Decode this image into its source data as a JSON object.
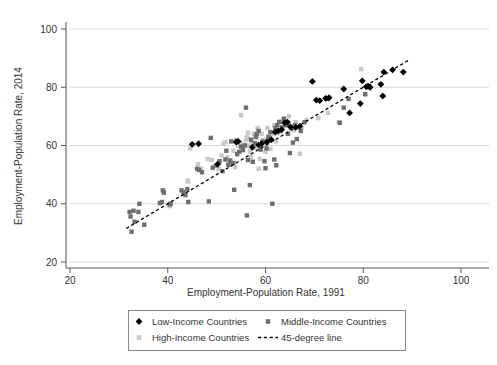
{
  "chart_data": {
    "type": "scatter",
    "title": "",
    "xlabel": "Employment-Population Rate, 1991",
    "ylabel": "Employment-Population Rate, 2014",
    "xlim": [
      20,
      100
    ],
    "ylim": [
      20,
      100
    ],
    "xticks": [
      20,
      40,
      60,
      80,
      100
    ],
    "yticks": [
      20,
      40,
      60,
      80,
      100
    ],
    "xtick_labels": [
      "20",
      "40",
      "60",
      "80",
      "100"
    ],
    "ytick_labels": [
      "20",
      "40",
      "60",
      "80",
      "100"
    ],
    "grid": "horizontal",
    "legend_position": "below-axes",
    "colors": {
      "low_income": "#000000",
      "middle_income": "#6e6e6e",
      "high_income": "#c9c9c9",
      "reference_line": "#000000",
      "gridline": "#d9d9d9",
      "axis": "#555555"
    },
    "reference_line": {
      "label": "45-degree line",
      "style": "dashed",
      "x0": 31.5,
      "y0": 31.5,
      "x1": 89.5,
      "y1": 89.5
    },
    "series": [
      {
        "name": "Low-Income Countries",
        "marker": "diamond",
        "color": "#000000",
        "points": [
          [
            45.0,
            60.4
          ],
          [
            46.3,
            60.6
          ],
          [
            50.2,
            53.6
          ],
          [
            54.0,
            61.2
          ],
          [
            54.4,
            61.4
          ],
          [
            57.3,
            59.4
          ],
          [
            58.6,
            60.2
          ],
          [
            59.2,
            60.6
          ],
          [
            60.3,
            61.2
          ],
          [
            61.2,
            62.0
          ],
          [
            62.0,
            64.6
          ],
          [
            62.6,
            65.0
          ],
          [
            63.3,
            65.4
          ],
          [
            63.9,
            67.8
          ],
          [
            64.5,
            68.0
          ],
          [
            65.1,
            66.4
          ],
          [
            66.2,
            66.2
          ],
          [
            67.0,
            66.6
          ],
          [
            69.6,
            82.0
          ],
          [
            70.4,
            75.6
          ],
          [
            71.1,
            75.4
          ],
          [
            72.3,
            76.2
          ],
          [
            73.0,
            76.4
          ],
          [
            76.0,
            79.4
          ],
          [
            77.2,
            71.2
          ],
          [
            79.4,
            74.4
          ],
          [
            79.8,
            82.2
          ],
          [
            80.6,
            80.2
          ],
          [
            81.0,
            80.4
          ],
          [
            81.4,
            80.0
          ],
          [
            83.6,
            81.0
          ],
          [
            84.0,
            77.0
          ],
          [
            84.2,
            85.2
          ],
          [
            86.0,
            86.0
          ],
          [
            88.2,
            85.2
          ]
        ]
      },
      {
        "name": "Middle-Income Countries",
        "marker": "square",
        "color": "#6e6e6e",
        "points": [
          [
            32.2,
            37.2
          ],
          [
            32.4,
            35.6
          ],
          [
            32.6,
            30.4
          ],
          [
            33.0,
            37.6
          ],
          [
            33.2,
            33.8
          ],
          [
            34.0,
            37.2
          ],
          [
            34.2,
            40.0
          ],
          [
            35.2,
            32.8
          ],
          [
            38.4,
            40.2
          ],
          [
            38.8,
            40.6
          ],
          [
            39.0,
            44.6
          ],
          [
            39.2,
            43.8
          ],
          [
            40.4,
            39.8
          ],
          [
            40.6,
            40.0
          ],
          [
            42.8,
            44.6
          ],
          [
            43.2,
            44.0
          ],
          [
            43.6,
            43.0
          ],
          [
            44.0,
            45.0
          ],
          [
            44.2,
            40.6
          ],
          [
            46.0,
            52.0
          ],
          [
            46.4,
            51.6
          ],
          [
            47.0,
            50.8
          ],
          [
            48.4,
            40.8
          ],
          [
            48.8,
            62.6
          ],
          [
            49.2,
            52.4
          ],
          [
            50.0,
            53.2
          ],
          [
            50.6,
            54.6
          ],
          [
            51.2,
            51.2
          ],
          [
            51.8,
            55.2
          ],
          [
            52.0,
            58.2
          ],
          [
            52.4,
            53.4
          ],
          [
            52.8,
            54.8
          ],
          [
            53.0,
            61.4
          ],
          [
            53.4,
            54.0
          ],
          [
            53.6,
            44.8
          ],
          [
            54.2,
            57.0
          ],
          [
            54.6,
            57.8
          ],
          [
            55.0,
            59.6
          ],
          [
            55.4,
            58.4
          ],
          [
            55.8,
            60.0
          ],
          [
            56.0,
            73.0
          ],
          [
            56.2,
            36.0
          ],
          [
            56.4,
            55.0
          ],
          [
            56.8,
            46.4
          ],
          [
            57.0,
            62.0
          ],
          [
            57.4,
            54.4
          ],
          [
            57.8,
            60.8
          ],
          [
            58.0,
            63.0
          ],
          [
            58.2,
            64.0
          ],
          [
            58.6,
            65.0
          ],
          [
            59.0,
            58.6
          ],
          [
            59.4,
            61.4
          ],
          [
            59.8,
            54.6
          ],
          [
            60.0,
            52.2
          ],
          [
            60.2,
            59.0
          ],
          [
            60.6,
            63.0
          ],
          [
            61.0,
            64.6
          ],
          [
            61.4,
            40.0
          ],
          [
            61.8,
            55.2
          ],
          [
            62.0,
            66.0
          ],
          [
            62.2,
            53.2
          ],
          [
            62.4,
            67.0
          ],
          [
            62.8,
            68.0
          ],
          [
            63.0,
            65.0
          ],
          [
            63.4,
            66.2
          ],
          [
            63.8,
            69.2
          ],
          [
            64.2,
            67.0
          ],
          [
            64.6,
            64.0
          ],
          [
            65.0,
            57.4
          ],
          [
            65.6,
            61.0
          ],
          [
            66.0,
            67.0
          ],
          [
            66.4,
            62.2
          ],
          [
            67.2,
            65.0
          ],
          [
            68.0,
            68.0
          ],
          [
            72.6,
            76.0
          ],
          [
            75.2,
            67.8
          ],
          [
            76.0,
            73.0
          ],
          [
            77.0,
            76.0
          ],
          [
            80.4,
            77.6
          ],
          [
            81.0,
            80.0
          ]
        ]
      },
      {
        "name": "High-Income Countries",
        "marker": "square",
        "color": "#c9c9c9",
        "points": [
          [
            40.4,
            39.2
          ],
          [
            44.0,
            48.0
          ],
          [
            44.2,
            47.6
          ],
          [
            44.6,
            59.0
          ],
          [
            45.0,
            60.2
          ],
          [
            46.2,
            53.6
          ],
          [
            46.8,
            52.0
          ],
          [
            48.2,
            55.4
          ],
          [
            49.0,
            55.0
          ],
          [
            49.6,
            53.0
          ],
          [
            50.4,
            52.0
          ],
          [
            51.0,
            56.6
          ],
          [
            51.4,
            60.6
          ],
          [
            51.8,
            61.2
          ],
          [
            52.2,
            56.0
          ],
          [
            52.6,
            55.0
          ],
          [
            53.0,
            53.4
          ],
          [
            53.4,
            58.2
          ],
          [
            53.8,
            52.6
          ],
          [
            54.0,
            62.0
          ],
          [
            54.4,
            60.0
          ],
          [
            54.8,
            61.0
          ],
          [
            55.0,
            70.4
          ],
          [
            55.2,
            59.6
          ],
          [
            55.6,
            60.4
          ],
          [
            56.0,
            62.0
          ],
          [
            56.2,
            63.0
          ],
          [
            56.4,
            64.4
          ],
          [
            56.6,
            60.0
          ],
          [
            56.8,
            58.0
          ],
          [
            57.0,
            56.0
          ],
          [
            57.2,
            61.4
          ],
          [
            57.6,
            64.0
          ],
          [
            58.0,
            59.2
          ],
          [
            58.2,
            62.6
          ],
          [
            58.4,
            66.0
          ],
          [
            58.6,
            52.0
          ],
          [
            58.8,
            55.4
          ],
          [
            59.0,
            60.0
          ],
          [
            59.2,
            64.0
          ],
          [
            59.6,
            62.0
          ],
          [
            60.0,
            57.8
          ],
          [
            60.4,
            66.0
          ],
          [
            60.8,
            62.4
          ],
          [
            61.0,
            58.8
          ],
          [
            61.4,
            64.0
          ],
          [
            61.8,
            67.0
          ],
          [
            62.2,
            61.4
          ],
          [
            62.6,
            64.2
          ],
          [
            63.0,
            68.4
          ],
          [
            63.2,
            66.0
          ],
          [
            63.6,
            69.0
          ],
          [
            64.0,
            68.2
          ],
          [
            64.4,
            67.0
          ],
          [
            64.8,
            70.0
          ],
          [
            65.2,
            66.0
          ],
          [
            65.8,
            65.2
          ],
          [
            66.2,
            68.0
          ],
          [
            67.0,
            57.2
          ],
          [
            67.4,
            66.0
          ],
          [
            68.4,
            68.8
          ],
          [
            70.8,
            69.4
          ],
          [
            72.8,
            71.2
          ],
          [
            75.0,
            68.0
          ],
          [
            79.6,
            86.2
          ],
          [
            81.2,
            80.4
          ]
        ]
      }
    ]
  },
  "legend": {
    "items": [
      {
        "label": "Low-Income Countries",
        "marker": "diamond",
        "color": "#000000"
      },
      {
        "label": "Middle-Income Countries",
        "marker": "square",
        "color": "#6e6e6e"
      },
      {
        "label": "High-Income Countries",
        "marker": "square",
        "color": "#c9c9c9"
      },
      {
        "label": "45-degree line",
        "marker": "dashed-line",
        "color": "#000000"
      }
    ]
  }
}
